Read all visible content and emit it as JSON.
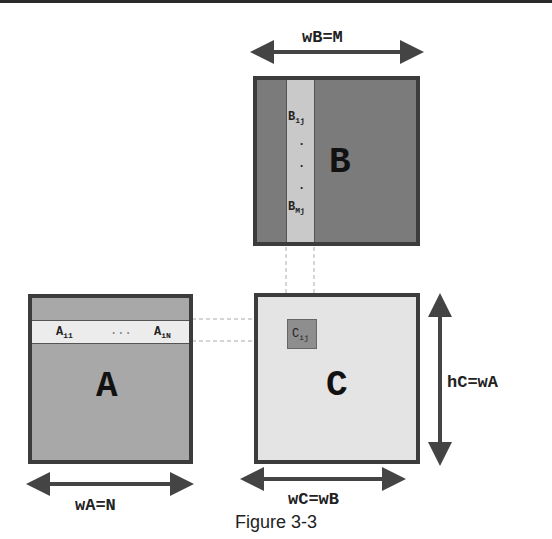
{
  "diagram": {
    "type": "matrix-multiplication",
    "matrices": {
      "A": {
        "label": "A",
        "row_labels": [
          "A_i1",
          "...",
          "A_iN"
        ],
        "row_first": "A",
        "row_first_sub": "i1",
        "row_ellipsis": "...",
        "row_last": "A",
        "row_last_sub": "iN",
        "fill": "#a8a8a8",
        "row_fill": "#ececec"
      },
      "B": {
        "label": "B",
        "col_first": "B",
        "col_first_sub": "1j",
        "col_last": "B",
        "col_last_sub": "Mj",
        "col_dots": "·",
        "fill": "#7b7b7b",
        "col_fill": "#c9c9c9"
      },
      "C": {
        "label": "C",
        "cell": "C",
        "cell_sub": "ij",
        "fill": "#e4e4e4",
        "cell_fill": "#8e8e8e"
      }
    },
    "dimensions": {
      "wB": "wB=M",
      "wA": "wA=N",
      "wC": "wC=wB",
      "hC": "hC=wA"
    },
    "caption": "Figure 3-3"
  }
}
